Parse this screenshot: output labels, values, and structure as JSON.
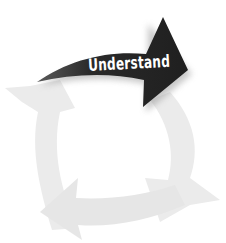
{
  "diagram": {
    "type": "cycle",
    "stages": [
      {
        "label": "Understand",
        "position": "top",
        "highlighted": true,
        "color": "#2e2e2e"
      },
      {
        "label": "",
        "position": "right",
        "highlighted": false,
        "color": "#e8e8e8"
      },
      {
        "label": "",
        "position": "bottom",
        "highlighted": false,
        "color": "#e8e8e8"
      },
      {
        "label": "",
        "position": "left",
        "highlighted": false,
        "color": "#e8e8e8"
      }
    ],
    "colors": {
      "active_arrow": "#2e2e2e",
      "active_text": "#ffffff",
      "faded_arrow": "#e8e8e8",
      "background": "#ffffff"
    }
  }
}
